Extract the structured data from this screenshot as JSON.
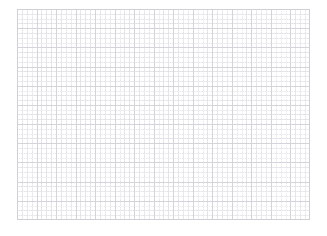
{
  "document": {
    "title": "",
    "type": "blank-grid-canvas",
    "description": ""
  },
  "canvas": {
    "width_px": 327,
    "height_px": 236,
    "background_color": "#ffffff"
  },
  "grid": {
    "left_px": 17,
    "top_px": 9,
    "width_px": 293,
    "height_px": 211,
    "major_columns": 15,
    "major_rows": 11,
    "major_spacing_px": 19.53,
    "major_row_spacing_px": 19.18,
    "minor_subdivisions_per_cell": 4,
    "minor_spacing_px": 4.88,
    "major_line_color": "#d4d4db",
    "minor_line_color": "#8c8ca0",
    "border_color": "#cfcfd6",
    "background_color": "#ffffff",
    "minor_line_style": "dotted",
    "major_line_style": "solid"
  },
  "content": {
    "items": [],
    "empty_state_text": ""
  }
}
